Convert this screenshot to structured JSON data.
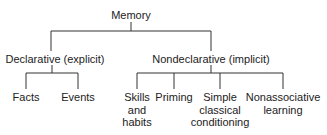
{
  "diagram": {
    "root": "Memory",
    "branches": [
      {
        "label": "Declarative (explicit)",
        "children": [
          "Facts",
          "Events"
        ]
      },
      {
        "label": "Nondeclarative (implicit)",
        "children": [
          [
            "Skills",
            "and",
            "habits"
          ],
          [
            "Priming"
          ],
          [
            "Simple",
            "classical",
            "conditioning"
          ],
          [
            "Nonassociative",
            "learning"
          ]
        ]
      }
    ]
  },
  "labels": {
    "root": "Memory",
    "declarative": "Declarative (explicit)",
    "nondeclarative": "Nondeclarative (implicit)",
    "facts": "Facts",
    "events": "Events",
    "skills_1": "Skills",
    "skills_2": "and",
    "skills_3": "habits",
    "priming": "Priming",
    "simple_1": "Simple",
    "simple_2": "classical",
    "simple_3": "conditioning",
    "nonassoc_1": "Nonassociative",
    "nonassoc_2": "learning"
  }
}
